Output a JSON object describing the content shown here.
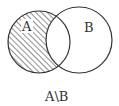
{
  "diagram": {
    "type": "venn",
    "sets": [
      {
        "label": "A",
        "cx": 39,
        "cy": 42,
        "r": 31
      },
      {
        "label": "B",
        "cx": 79,
        "cy": 40,
        "r": 33
      }
    ],
    "shaded_region": "A minus B",
    "caption": "A\\B",
    "colors": {
      "stroke": "#333333",
      "hatch": "#333333",
      "background": "#ffffff"
    }
  }
}
